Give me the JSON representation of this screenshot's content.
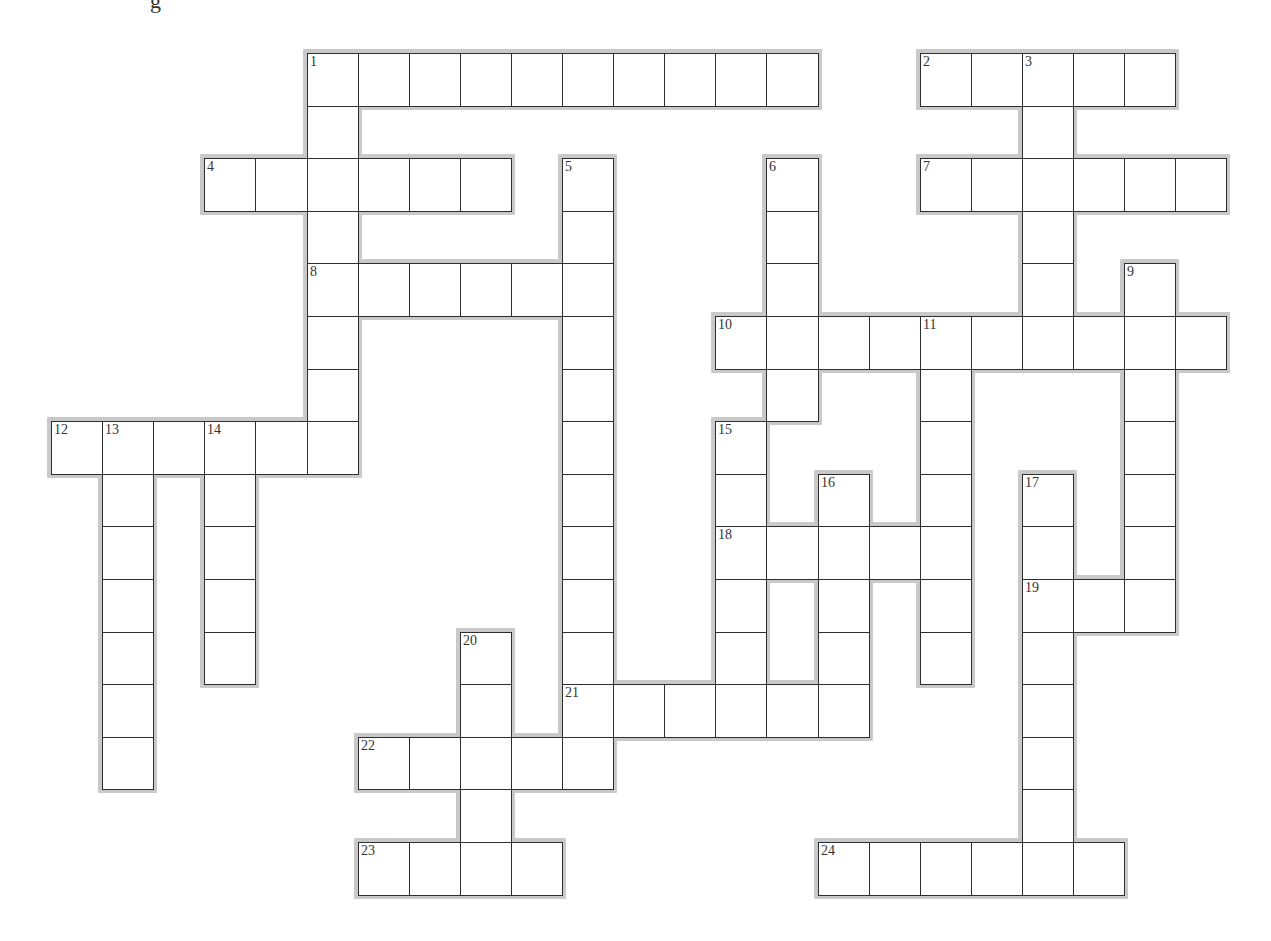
{
  "page": {
    "title_fragment": "g"
  },
  "grid": {
    "origin_x": 51,
    "origin_y": 53,
    "cell_width": 51.1,
    "cell_height": 52.6,
    "rows": 16,
    "cols": 23,
    "colors": {
      "cell_fill": "#ffffff",
      "cell_border": "#2e2e2e",
      "halo": "#c9c9c9",
      "number_text": "#333333"
    }
  },
  "entries": {
    "across": [
      {
        "number": "1",
        "row": 0,
        "col": 5,
        "length": 10
      },
      {
        "number": "2",
        "row": 0,
        "col": 17,
        "length": 5
      },
      {
        "number": "4",
        "row": 2,
        "col": 3,
        "length": 6
      },
      {
        "number": "7",
        "row": 2,
        "col": 17,
        "length": 6
      },
      {
        "number": "8",
        "row": 4,
        "col": 5,
        "length": 6
      },
      {
        "number": "10",
        "row": 5,
        "col": 13,
        "length": 10
      },
      {
        "number": "12",
        "row": 7,
        "col": 0,
        "length": 6
      },
      {
        "number": "18",
        "row": 9,
        "col": 13,
        "length": 5
      },
      {
        "number": "19",
        "row": 10,
        "col": 19,
        "length": 3
      },
      {
        "number": "21",
        "row": 12,
        "col": 10,
        "length": 6
      },
      {
        "number": "22",
        "row": 13,
        "col": 6,
        "length": 5
      },
      {
        "number": "23",
        "row": 15,
        "col": 6,
        "length": 4
      },
      {
        "number": "24",
        "row": 15,
        "col": 15,
        "length": 6
      }
    ],
    "down": [
      {
        "number": "1",
        "row": 0,
        "col": 5,
        "length": 8
      },
      {
        "number": "3",
        "row": 0,
        "col": 19,
        "length": 6
      },
      {
        "number": "5",
        "row": 2,
        "col": 10,
        "length": 12
      },
      {
        "number": "6",
        "row": 2,
        "col": 14,
        "length": 5
      },
      {
        "number": "9",
        "row": 4,
        "col": 21,
        "length": 7
      },
      {
        "number": "11",
        "row": 5,
        "col": 17,
        "length": 7
      },
      {
        "number": "13",
        "row": 7,
        "col": 1,
        "length": 7
      },
      {
        "number": "14",
        "row": 7,
        "col": 3,
        "length": 5
      },
      {
        "number": "15",
        "row": 7,
        "col": 13,
        "length": 6
      },
      {
        "number": "16",
        "row": 8,
        "col": 15,
        "length": 5
      },
      {
        "number": "17",
        "row": 8,
        "col": 19,
        "length": 8
      },
      {
        "number": "20",
        "row": 11,
        "col": 8,
        "length": 5
      }
    ]
  }
}
